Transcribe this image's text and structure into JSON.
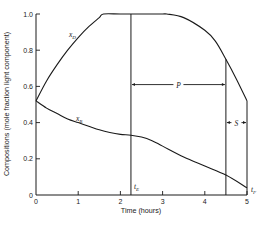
{
  "chart_data": {
    "type": "line",
    "title": "",
    "xlabel": "Time (hours)",
    "ylabel": "Compositions (mole fraction light component)",
    "xlim": [
      0,
      5
    ],
    "ylim": [
      0,
      1.0
    ],
    "x_ticks": [
      "0",
      "1",
      "2",
      "3",
      "4",
      "5"
    ],
    "y_ticks": [
      "0",
      "0.2",
      "0.4",
      "0.6",
      "0.8",
      "1.0"
    ],
    "grid": false,
    "legend": "inline labels",
    "series": [
      {
        "name": "x_D",
        "label_main": "x",
        "label_sub": "D",
        "x": [
          0,
          0.25,
          0.5,
          0.75,
          1.0,
          1.25,
          1.5,
          1.6,
          2.0,
          2.5,
          3.0,
          3.1,
          3.5,
          4.0,
          4.25,
          4.5,
          4.75,
          5.0
        ],
        "y": [
          0.52,
          0.63,
          0.72,
          0.8,
          0.87,
          0.93,
          0.98,
          1.0,
          1.0,
          1.0,
          1.0,
          1.0,
          0.98,
          0.91,
          0.85,
          0.75,
          0.64,
          0.52
        ]
      },
      {
        "name": "x_B",
        "label_main": "x",
        "label_sub": "B",
        "x": [
          0,
          0.25,
          0.5,
          0.75,
          1.0,
          1.25,
          1.5,
          1.75,
          2.0,
          2.25,
          2.5,
          2.75,
          3.0,
          3.5,
          4.0,
          4.5,
          5.0
        ],
        "y": [
          0.52,
          0.48,
          0.45,
          0.42,
          0.4,
          0.38,
          0.36,
          0.345,
          0.335,
          0.33,
          0.32,
          0.3,
          0.27,
          0.21,
          0.16,
          0.11,
          0.04
        ]
      }
    ],
    "annotations": {
      "vlines": [
        {
          "x": 2.25,
          "label_main": "t",
          "label_sub": "E",
          "y_top": 1.0
        },
        {
          "x": 4.5,
          "label_main": "",
          "label_sub": "",
          "y_top": 0.75
        },
        {
          "x": 5.0,
          "label_main": "t",
          "label_sub": "F",
          "y_top": 0.52
        }
      ],
      "spans": [
        {
          "label": "P",
          "x_from": 2.25,
          "x_to": 4.5,
          "y": 0.61
        },
        {
          "label": "S",
          "x_from": 4.5,
          "x_to": 5.0,
          "y": 0.4
        }
      ]
    }
  }
}
